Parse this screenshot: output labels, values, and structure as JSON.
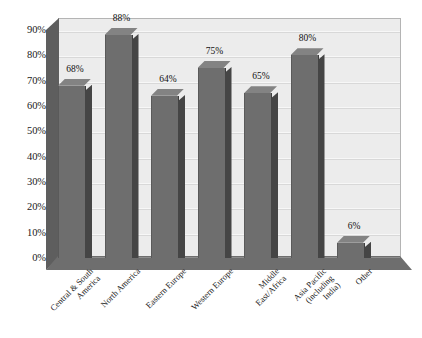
{
  "chart_data": {
    "type": "bar",
    "title": "",
    "subtitle": "",
    "xlabel": "",
    "ylabel": "",
    "categories": [
      "Central & South America",
      "North America",
      "Eastern Europe",
      "Western Europe",
      "Middle East/Africa",
      "Asia Pacific (including India)",
      "Other"
    ],
    "category_lines": [
      [
        "Central & South",
        "America"
      ],
      [
        "North America"
      ],
      [
        "Eastern Europe"
      ],
      [
        "Western Europe"
      ],
      [
        "Middle",
        "East/Africa"
      ],
      [
        "Asia Pacific",
        "(including",
        "India)"
      ],
      [
        "Other"
      ]
    ],
    "values": [
      68,
      88,
      64,
      75,
      65,
      80,
      6
    ],
    "value_labels": [
      "68%",
      "88%",
      "64%",
      "75%",
      "65%",
      "80%",
      "6%"
    ],
    "ylim": [
      0,
      90
    ],
    "ytick_labels": [
      "90%",
      "80%",
      "70%",
      "60%",
      "50%",
      "40%",
      "30%",
      "20%",
      "10%",
      "0%"
    ],
    "ytick_values": [
      90,
      80,
      70,
      60,
      50,
      40,
      30,
      20,
      10,
      0
    ],
    "grid": true,
    "legend": "none",
    "style": "3d-column",
    "colors": {
      "bar_front": "#6e6e6e",
      "bar_side": "#454545",
      "bar_top": "#838383",
      "plot_background": "#ececec",
      "gridline": "#d8d8d8",
      "floor": "#6e6e6e",
      "left_wall": "#5e5e5e",
      "text": "#1a1a1a"
    }
  }
}
